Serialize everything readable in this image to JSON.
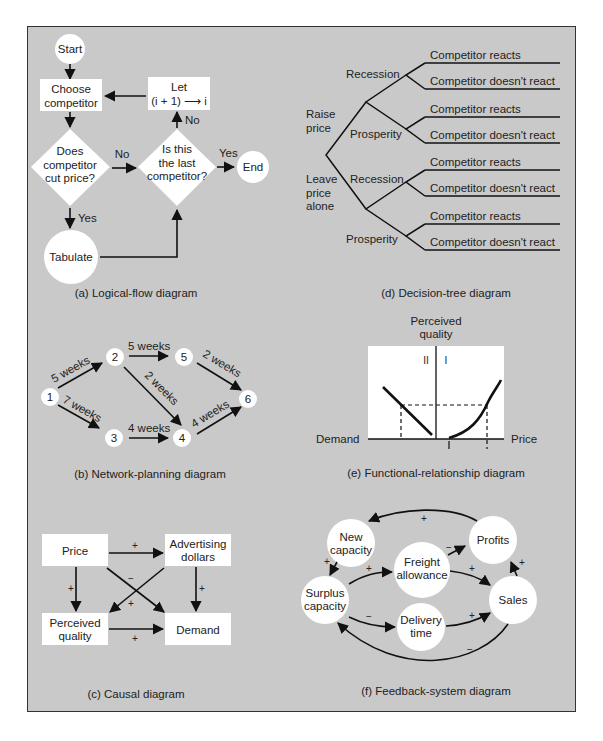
{
  "panels": {
    "a": {
      "caption": "(a) Logical-flow diagram",
      "start": "Start",
      "choose_1": "Choose",
      "choose_2": "competitor",
      "let_1": "Let",
      "let_2": "(i + 1) ⟶ i",
      "does_1": "Does",
      "does_2": "competitor",
      "does_3": "cut price?",
      "last_1": "Is this",
      "last_2": "the last",
      "last_3": "competitor?",
      "end": "End",
      "tabulate": "Tabulate",
      "no_1": "No",
      "no_2": "No",
      "yes_1": "Yes",
      "yes_2": "Yes"
    },
    "d": {
      "caption": "(d) Decision-tree diagram",
      "raise_1": "Raise",
      "raise_2": "price",
      "leave_1": "Leave",
      "leave_2": "price",
      "leave_3": "alone",
      "recession": "Recession",
      "prosperity": "Prosperity",
      "reacts": "Competitor reacts",
      "not_react": "Competitor doesn't react"
    },
    "b": {
      "caption": "(b) Network-planning diagram",
      "nodes": [
        "1",
        "2",
        "3",
        "4",
        "5",
        "6"
      ],
      "e12": "5 weeks",
      "e13": "7 weeks",
      "e25": "5 weeks",
      "e24": "2 weeks",
      "e34": "4 weeks",
      "e56": "2 weeks",
      "e46": "4 weeks"
    },
    "e": {
      "caption": "(e) Functional-relationship diagram",
      "ylabel_1": "Perceived",
      "ylabel_2": "quality",
      "quad_2": "II",
      "quad_1": "I",
      "xleft": "Demand",
      "xright": "Price"
    },
    "c": {
      "caption": "(c) Causal diagram",
      "price": "Price",
      "adv_1": "Advertising",
      "adv_2": "dollars",
      "pq_1": "Perceived",
      "pq_2": "quality",
      "demand": "Demand",
      "plus": "+",
      "minus": "−"
    },
    "f": {
      "caption": "(f) Feedback-system diagram",
      "newcap_1": "New",
      "newcap_2": "capacity",
      "profits": "Profits",
      "freight_1": "Freight",
      "freight_2": "allowance",
      "surplus_1": "Surplus",
      "surplus_2": "capacity",
      "sales": "Sales",
      "delivery_1": "Delivery",
      "delivery_2": "time",
      "plus": "+",
      "minus": "−"
    }
  }
}
